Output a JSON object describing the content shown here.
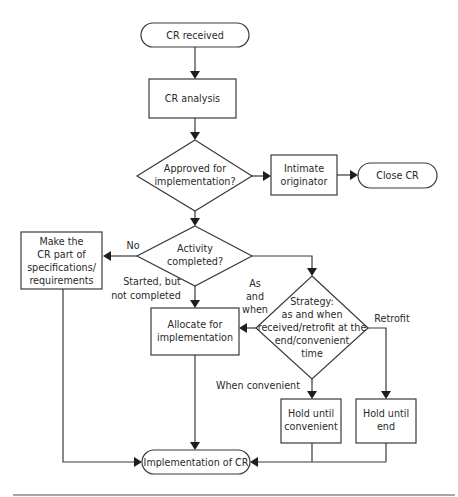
{
  "diagram": {
    "type": "flowchart",
    "nodes": {
      "cr_received": {
        "kind": "terminal",
        "lines": [
          "CR received"
        ]
      },
      "cr_analysis": {
        "kind": "process",
        "lines": [
          "CR analysis"
        ]
      },
      "approved": {
        "kind": "decision",
        "lines": [
          "Approved for",
          "implementation?"
        ]
      },
      "intimate": {
        "kind": "process",
        "lines": [
          "Intimate",
          "originator"
        ]
      },
      "close_cr": {
        "kind": "terminal",
        "lines": [
          "Close CR"
        ]
      },
      "activity": {
        "kind": "decision",
        "lines": [
          "Activity",
          "completed?"
        ]
      },
      "make_part": {
        "kind": "process",
        "lines": [
          "Make the",
          "CR part of",
          "specifications/",
          "requirements"
        ]
      },
      "allocate": {
        "kind": "process",
        "lines": [
          "Allocate for",
          "implementation"
        ]
      },
      "strategy": {
        "kind": "decision",
        "lines": [
          "Strategy:",
          "as and when",
          "received/retrofit at the",
          "end/convenient",
          "time"
        ]
      },
      "hold_convenient": {
        "kind": "process",
        "lines": [
          "Hold until",
          "convenient"
        ]
      },
      "hold_end": {
        "kind": "process",
        "lines": [
          "Hold until",
          "end"
        ]
      },
      "implementation": {
        "kind": "terminal",
        "lines": [
          "Implementation of CR"
        ]
      }
    },
    "edge_labels": {
      "no": "No",
      "started": [
        "Started, but",
        "not completed"
      ],
      "as_and_when": [
        "As",
        "and",
        "when"
      ],
      "retrofit": "Retrofit",
      "when_convenient": "When convenient"
    },
    "edges": [
      [
        "cr_received",
        "cr_analysis"
      ],
      [
        "cr_analysis",
        "approved"
      ],
      [
        "approved",
        "intimate"
      ],
      [
        "intimate",
        "close_cr"
      ],
      [
        "approved",
        "activity"
      ],
      [
        "activity",
        "make_part",
        "No"
      ],
      [
        "activity",
        "allocate",
        "Started, but not completed"
      ],
      [
        "activity",
        "strategy"
      ],
      [
        "strategy",
        "allocate",
        "As and when"
      ],
      [
        "strategy",
        "hold_convenient",
        "When convenient"
      ],
      [
        "strategy",
        "hold_end",
        "Retrofit"
      ],
      [
        "make_part",
        "implementation"
      ],
      [
        "allocate",
        "implementation"
      ],
      [
        "hold_convenient",
        "implementation"
      ],
      [
        "hold_end",
        "implementation"
      ]
    ]
  }
}
